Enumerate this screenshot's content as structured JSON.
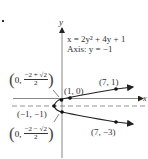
{
  "problem_marker": ".",
  "equation": "x = 2y² + 4y + 1",
  "axis_label": "Axis: y = −1",
  "axes": {
    "x_label": "x",
    "y_label": "y"
  },
  "points": {
    "vertex": "(−1, −1)",
    "x_intercept": "(1, 0)",
    "upper_right": "(7, 1)",
    "lower_right": "(7, −3)"
  },
  "y_intercepts": {
    "upper": {
      "x": "0",
      "numerator": "−2 + √2",
      "denominator": "2"
    },
    "lower": {
      "x": "0",
      "numerator": "−2 − √2",
      "denominator": "2"
    }
  },
  "colors": {
    "ink": "#222222",
    "axis": "#888888",
    "dash": "#777777"
  }
}
